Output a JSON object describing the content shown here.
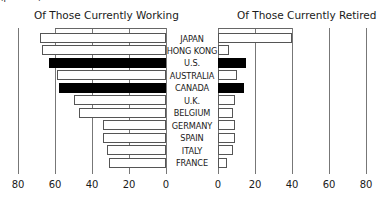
{
  "top_note": "(percent)",
  "titles": {
    "left": "Of Those Currently Working",
    "right": "Of Those Currently Retired"
  },
  "colors": {
    "highlight": "#000000",
    "bar": "#ffffff",
    "border": "#555555"
  },
  "chart_data": [
    {
      "type": "bar",
      "orientation": "horizontal",
      "title": "Of Those Currently Working",
      "direction": "right-to-left",
      "categories": [
        "JAPAN",
        "HONG KONG",
        "U.S.",
        "AUSTRALIA",
        "CANADA",
        "U.K.",
        "BELGIUM",
        "GERMANY",
        "SPAIN",
        "ITALY",
        "FRANCE"
      ],
      "values": [
        68,
        67,
        63,
        59,
        58,
        50,
        47,
        34,
        34,
        32,
        31
      ],
      "highlighted": [
        "U.S.",
        "CANADA"
      ],
      "xlim": [
        80,
        0
      ],
      "xticks": [
        "80",
        "60",
        "40",
        "20",
        "0"
      ],
      "grid": true
    },
    {
      "type": "bar",
      "orientation": "horizontal",
      "title": "Of Those Currently Retired",
      "direction": "left-to-right",
      "categories": [
        "JAPAN",
        "HONG KONG",
        "U.S.",
        "AUSTRALIA",
        "CANADA",
        "U.K.",
        "BELGIUM",
        "GERMANY",
        "SPAIN",
        "ITALY",
        "FRANCE"
      ],
      "values": [
        40,
        6,
        15,
        10,
        14,
        9,
        8,
        9,
        9,
        8,
        5
      ],
      "highlighted": [
        "U.S.",
        "CANADA"
      ],
      "xlim": [
        0,
        80
      ],
      "xticks": [
        "0",
        "20",
        "40",
        "60",
        "80"
      ],
      "grid": true
    }
  ]
}
